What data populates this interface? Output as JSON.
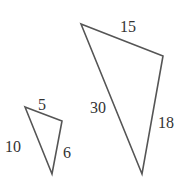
{
  "diagram": {
    "type": "similar-triangles",
    "stroke_color": "#555555",
    "label_color": "#333333",
    "triangles": [
      {
        "name": "small-triangle",
        "points": "25,107 62,121 52,174",
        "labels": [
          {
            "side": "top",
            "text": "5",
            "x": 42,
            "y": 110
          },
          {
            "side": "left",
            "text": "10",
            "x": 13,
            "y": 152
          },
          {
            "side": "right",
            "text": "6",
            "x": 62,
            "y": 158
          }
        ]
      },
      {
        "name": "large-triangle",
        "points": "81,24 163,56 142,174",
        "labels": [
          {
            "side": "top",
            "text": "15",
            "x": 128,
            "y": 32
          },
          {
            "side": "left",
            "text": "30",
            "x": 98,
            "y": 113
          },
          {
            "side": "right",
            "text": "18",
            "x": 165,
            "y": 128
          }
        ]
      }
    ]
  }
}
